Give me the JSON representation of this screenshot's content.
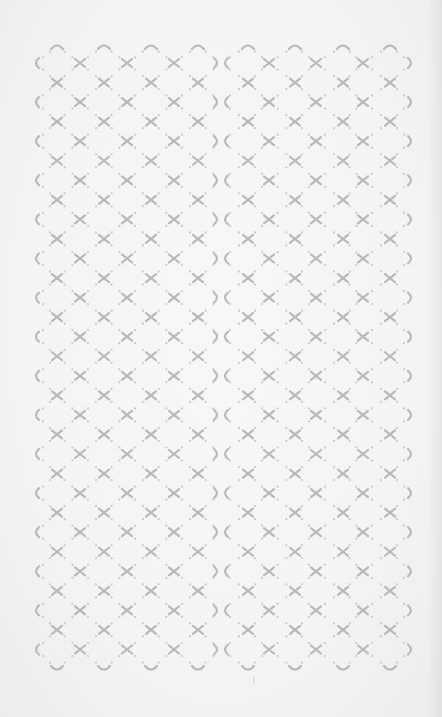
{
  "image": {
    "description": "Light gray geometric lattice pattern on near-white paper",
    "background_color": "#f4f4f4",
    "motif_color": "#b9b9b9",
    "dot_color": "#c8c8c8"
  },
  "pattern": {
    "tiles_horizontal": 2,
    "seam_x": 221,
    "col_spacing": 47.2,
    "row_spacing": 39.1,
    "left_edge_x": 36,
    "right_edge_x": 411,
    "top_arc_y": 46,
    "first_row_y": 63,
    "edge_rows": 16,
    "middle_rows": 15,
    "bottom_arc_y": 669,
    "top_arc_x": [
      57,
      104,
      151,
      198,
      248,
      295,
      343,
      390
    ],
    "edge_row_cross_x": [
      80,
      127,
      174,
      269,
      316,
      363
    ],
    "middle_row_cross_x": [
      57,
      104,
      151,
      198,
      248,
      295,
      343,
      390
    ],
    "stray_mark": {
      "x": 254,
      "y": 680
    }
  }
}
